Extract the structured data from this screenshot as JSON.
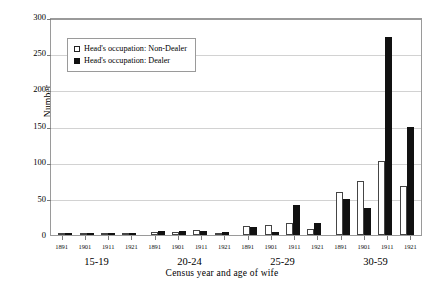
{
  "chart_data": {
    "type": "bar",
    "title": "",
    "xlabel": "Census year and age of wife",
    "ylabel": "Number",
    "ylim": [
      0,
      300
    ],
    "ytick_step": 50,
    "yticks": [
      300,
      250,
      200,
      150,
      100,
      50,
      0
    ],
    "grid": true,
    "legend_position": "upper-left-inside",
    "grouping": "age group of wife, then census year",
    "census_years": [
      "1891",
      "1901",
      "1911",
      "1921"
    ],
    "categories": [
      "15-19 1891",
      "15-19 1901",
      "15-19 1911",
      "15-19 1921",
      "20-24 1891",
      "20-24 1901",
      "20-24 1911",
      "20-24 1921",
      "25-29 1891",
      "25-29 1901",
      "25-29 1911",
      "25-29 1921",
      "30-59 1891",
      "30-59 1901",
      "30-59 1911",
      "30-59 1921"
    ],
    "age_groups": [
      "15-19",
      "20-24",
      "25-29",
      "30-59"
    ],
    "series": [
      {
        "name": "Head's occupation: Non-Dealer",
        "color": "#ffffff",
        "edge_color": "#454545",
        "values": [
          0,
          0,
          0,
          0,
          4,
          4,
          7,
          2,
          13,
          14,
          16,
          9,
          60,
          75,
          103,
          68
        ]
      },
      {
        "name": "Head's occupation: Dealer",
        "color": "#111111",
        "edge_color": "#111111",
        "values": [
          0,
          0,
          0,
          0,
          6,
          6,
          6,
          4,
          11,
          4,
          41,
          16,
          50,
          38,
          275,
          150
        ]
      }
    ]
  },
  "legend": {
    "entries": [
      {
        "label": "Head's occupation: Non-Dealer",
        "swatch": "open-square"
      },
      {
        "label": "Head's occupation: Dealer",
        "swatch": "filled-square"
      }
    ]
  },
  "axes": {
    "y_title": "Number",
    "x_title": "Census year and age of wife",
    "y_tick_labels": [
      "300",
      "250",
      "200",
      "150",
      "100",
      "50",
      "0"
    ]
  },
  "groups": [
    {
      "label": "15-19",
      "years": [
        {
          "year": "1891",
          "non_dealer": 0,
          "dealer": 0
        },
        {
          "year": "1901",
          "non_dealer": 0,
          "dealer": 0
        },
        {
          "year": "1911",
          "non_dealer": 0,
          "dealer": 0
        },
        {
          "year": "1921",
          "non_dealer": 0,
          "dealer": 0
        }
      ]
    },
    {
      "label": "20-24",
      "years": [
        {
          "year": "1891",
          "non_dealer": 4,
          "dealer": 6
        },
        {
          "year": "1901",
          "non_dealer": 4,
          "dealer": 6
        },
        {
          "year": "1911",
          "non_dealer": 7,
          "dealer": 6
        },
        {
          "year": "1921",
          "non_dealer": 2,
          "dealer": 4
        }
      ]
    },
    {
      "label": "25-29",
      "years": [
        {
          "year": "1891",
          "non_dealer": 13,
          "dealer": 11
        },
        {
          "year": "1901",
          "non_dealer": 14,
          "dealer": 4
        },
        {
          "year": "1911",
          "non_dealer": 16,
          "dealer": 41
        },
        {
          "year": "1921",
          "non_dealer": 9,
          "dealer": 16
        }
      ]
    },
    {
      "label": "30-59",
      "years": [
        {
          "year": "1891",
          "non_dealer": 60,
          "dealer": 50
        },
        {
          "year": "1901",
          "non_dealer": 75,
          "dealer": 38
        },
        {
          "year": "1911",
          "non_dealer": 103,
          "dealer": 275
        },
        {
          "year": "1921",
          "non_dealer": 68,
          "dealer": 150
        }
      ]
    }
  ],
  "colors": {
    "non_dealer_fill": "#ffffff",
    "dealer_fill": "#111111",
    "border": "#9a9a9a",
    "gridline": "#d2d2d2"
  }
}
